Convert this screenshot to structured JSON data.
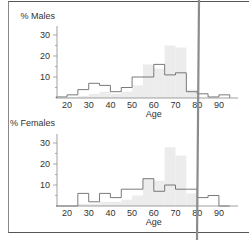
{
  "chart_data": [
    {
      "type": "bar",
      "title": "% Males",
      "xlabel": "Age",
      "ylabel": "% Males",
      "ylim": [
        0,
        35
      ],
      "xlim": [
        15,
        97
      ],
      "yticks": [
        10,
        20,
        30
      ],
      "xticks": [
        20,
        30,
        40,
        50,
        60,
        70,
        80,
        90
      ],
      "bin_width": 5,
      "series": [
        {
          "name": "outline",
          "bins": [
            15,
            20,
            25,
            30,
            35,
            40,
            45,
            50,
            55,
            60,
            65,
            70,
            75,
            80,
            85,
            90
          ],
          "values": [
            0.5,
            1.5,
            4,
            7,
            6,
            3,
            5,
            10,
            10,
            16,
            11,
            12,
            3,
            2,
            0.5,
            1.5
          ]
        },
        {
          "name": "shaded",
          "bins": [
            15,
            20,
            25,
            30,
            35,
            40,
            45,
            50,
            55,
            60,
            65,
            70,
            75,
            80,
            85,
            90
          ],
          "values": [
            0,
            0.5,
            1,
            2,
            3,
            2,
            3,
            6,
            16,
            14,
            25,
            24,
            4,
            0,
            0,
            0
          ]
        }
      ]
    },
    {
      "type": "bar",
      "title": "% Females",
      "xlabel": "Age",
      "ylabel": "% Females",
      "ylim": [
        0,
        35
      ],
      "xlim": [
        15,
        97
      ],
      "yticks": [
        10,
        20,
        30
      ],
      "xticks": [
        20,
        30,
        40,
        50,
        60,
        70,
        80,
        90
      ],
      "bin_width": 5,
      "series": [
        {
          "name": "outline",
          "bins": [
            15,
            20,
            25,
            30,
            35,
            40,
            45,
            50,
            55,
            60,
            65,
            70,
            75,
            80,
            85,
            90
          ],
          "values": [
            0,
            0,
            6,
            2,
            6,
            4,
            8,
            8,
            13,
            7,
            10,
            8,
            8,
            4,
            5,
            0
          ]
        },
        {
          "name": "shaded",
          "bins": [
            15,
            20,
            25,
            30,
            35,
            40,
            45,
            50,
            55,
            60,
            65,
            70,
            75,
            80,
            85,
            90
          ],
          "values": [
            0,
            0,
            1,
            1,
            2,
            2,
            3,
            5,
            13,
            12,
            28,
            24,
            6,
            0,
            0,
            0
          ]
        }
      ]
    }
  ],
  "labels": {
    "males_title": "% Males",
    "females_title": "% Females",
    "xlabel": "Age",
    "yticks": [
      "30",
      "20",
      "10"
    ],
    "xticks": [
      "20",
      "30",
      "40",
      "50",
      "60",
      "70",
      "80",
      "90"
    ]
  },
  "colors": {
    "outline": "#6b6b6b",
    "shaded": "#ececec",
    "axis": "#888888",
    "divider": "#8c8c8c"
  }
}
